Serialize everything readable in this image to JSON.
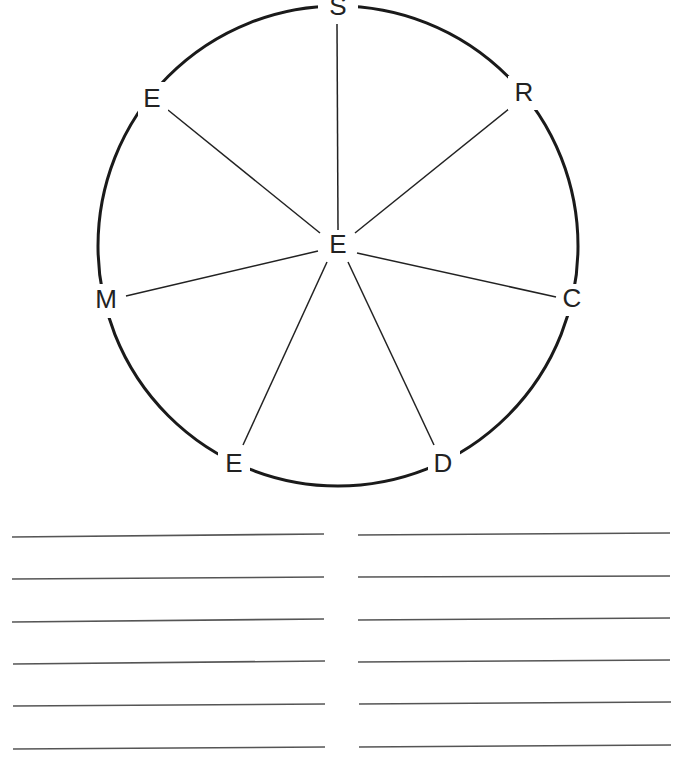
{
  "diagram": {
    "type": "radial-word-wheel",
    "center": {
      "letter": "E",
      "x": 338,
      "y": 246
    },
    "circle": {
      "cx": 338,
      "cy": 246,
      "r": 240,
      "stroke": "#1a1a1a"
    },
    "outer_letters": [
      {
        "letter": "S",
        "x": 338,
        "y": 8
      },
      {
        "letter": "R",
        "x": 524,
        "y": 94
      },
      {
        "letter": "C",
        "x": 572,
        "y": 300
      },
      {
        "letter": "D",
        "x": 443,
        "y": 465
      },
      {
        "letter": "E",
        "x": 234,
        "y": 465
      },
      {
        "letter": "M",
        "x": 106,
        "y": 301
      },
      {
        "letter": "E",
        "x": 152,
        "y": 100
      }
    ]
  },
  "answer_lines": {
    "left_column": 6,
    "right_column": 6,
    "y_positions": [
      536,
      578,
      621,
      663,
      705,
      748
    ]
  }
}
